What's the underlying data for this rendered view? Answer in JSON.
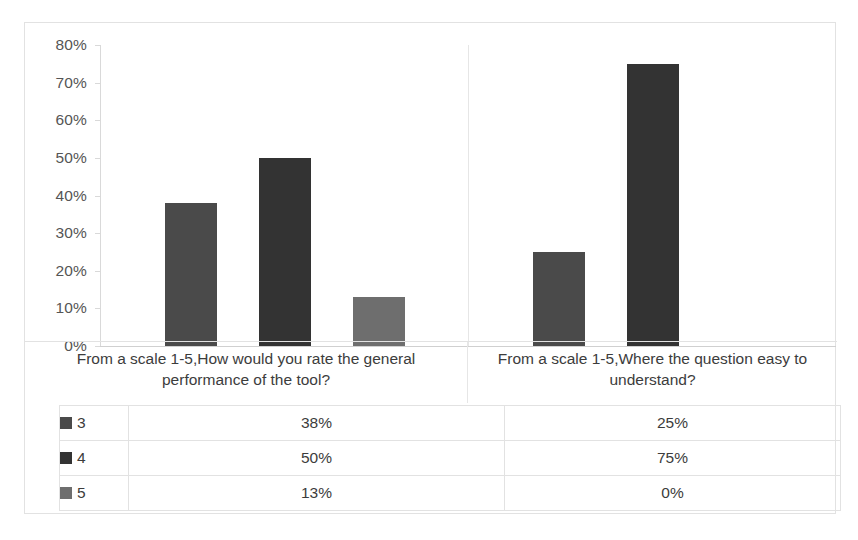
{
  "chart_data": {
    "type": "bar",
    "title": "",
    "subtitle": "",
    "xlabel": "",
    "ylabel": "",
    "ylim": [
      0,
      0.8
    ],
    "grid": false,
    "legend_position": "data-table-left",
    "data_table_visible": true,
    "axis_tick_format": "percent",
    "categories": [
      "From a scale 1-5,How would you rate the general performance of the tool?",
      "From a scale 1-5,Where the question easy to understand?"
    ],
    "ytick_labels": [
      "80%",
      "70%",
      "60%",
      "50%",
      "40%",
      "30%",
      "20%",
      "10%",
      "0%"
    ],
    "ytick_values": [
      0.8,
      0.7,
      0.6,
      0.5,
      0.4,
      0.3,
      0.2,
      0.1,
      0.0
    ],
    "series": [
      {
        "name": "3",
        "color": "#4a4a4a",
        "values": [
          0.38,
          0.25
        ],
        "labels": [
          "38%",
          "25%"
        ]
      },
      {
        "name": "4",
        "color": "#333333",
        "values": [
          0.5,
          0.75
        ],
        "labels": [
          "50%",
          "75%"
        ]
      },
      {
        "name": "5",
        "color": "#6e6e6e",
        "values": [
          0.13,
          0.0
        ],
        "labels": [
          "13%",
          "0%"
        ]
      }
    ]
  },
  "table": {
    "rows": [
      {
        "key": "3",
        "swatch_color": "#4a4a4a",
        "values": [
          "38%",
          "25%"
        ]
      },
      {
        "key": "4",
        "swatch_color": "#333333",
        "values": [
          "50%",
          "75%"
        ]
      },
      {
        "key": "5",
        "swatch_color": "#6e6e6e",
        "values": [
          "13%",
          "0%"
        ]
      }
    ]
  },
  "colors": {
    "frame_border": "#e2e2e2",
    "axis_line": "#d9d9d9",
    "text": "#3c3c3c",
    "tick_text": "#555555",
    "background": "#ffffff"
  }
}
